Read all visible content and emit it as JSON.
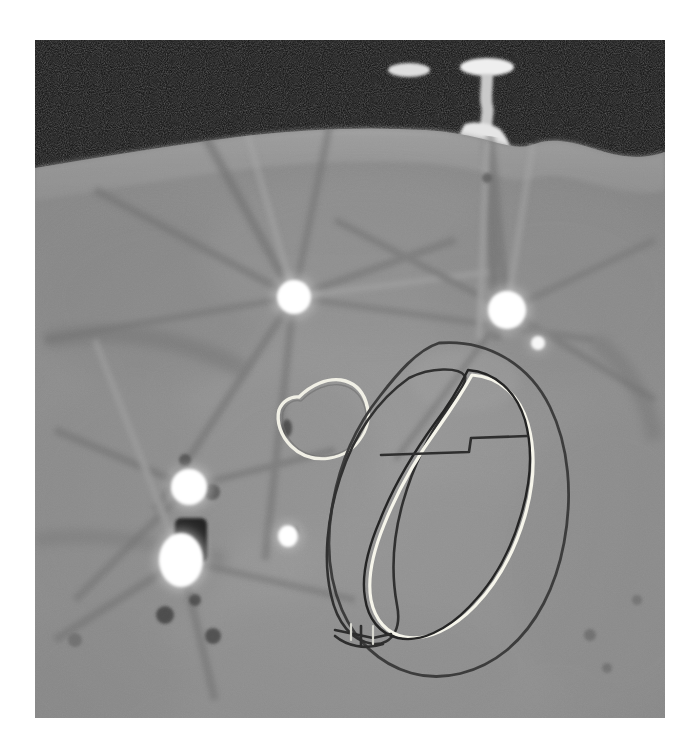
{
  "viewer": {
    "title": "CT Axial Slice — Brachytherapy Planning",
    "modality": "CT",
    "colormap": "grayscale",
    "background_color": "#ffffff"
  },
  "image_pane": {
    "left": 35,
    "top": 40,
    "width": 630,
    "height": 678,
    "air_color": "#0c0c0c",
    "soft_tissue_color": "#8e8e8e",
    "fat_color": "#9b9b9b",
    "dense_tissue_color": "#7c7c7c",
    "metal_color": "#ffffff"
  },
  "anatomy": {
    "body_surface_label": "skin-surface",
    "body_fill": "#8d8d8d",
    "subcutaneous_fill": "#9a9a9a"
  },
  "fiducials": [
    {
      "name": "applicator-cap-left",
      "cx": 409,
      "cy": 70,
      "rx": 20,
      "ry": 7,
      "brightness": "#e8e8e8"
    },
    {
      "name": "applicator-cap-right",
      "cx": 487,
      "cy": 68,
      "rx": 26,
      "ry": 9,
      "brightness": "#f2f2f2"
    },
    {
      "name": "applicator-shaft",
      "cx": 487,
      "cy": 95,
      "rx": 5,
      "ry": 22,
      "brightness": "#cfcfcf"
    },
    {
      "name": "applicator-base",
      "cx": 487,
      "cy": 125,
      "rx": 17,
      "ry": 17,
      "brightness": "#e3e3e3"
    },
    {
      "name": "catheter-marker-upper-left",
      "cx": 294,
      "cy": 297,
      "rx": 17,
      "ry": 17,
      "brightness": "#ffffff"
    },
    {
      "name": "catheter-marker-upper-right",
      "cx": 507,
      "cy": 310,
      "rx": 19,
      "ry": 19,
      "brightness": "#ffffff"
    },
    {
      "name": "catheter-marker-small-right",
      "cx": 538,
      "cy": 343,
      "rx": 7,
      "ry": 7,
      "brightness": "#f6f6f6"
    },
    {
      "name": "catheter-marker-mid-left",
      "cx": 189,
      "cy": 487,
      "rx": 18,
      "ry": 18,
      "brightness": "#ffffff"
    },
    {
      "name": "catheter-marker-lower-left",
      "cx": 181,
      "cy": 560,
      "rx": 22,
      "ry": 27,
      "brightness": "#ffffff"
    },
    {
      "name": "catheter-marker-center",
      "cx": 288,
      "cy": 536,
      "rx": 10,
      "ry": 11,
      "brightness": "#ffffff"
    }
  ],
  "contours": [
    {
      "name": "bladder-contour",
      "style": "light",
      "color": "#f0efe4",
      "stroke_width": 3.2,
      "description": "small rounded structure, upper-left of target"
    },
    {
      "name": "ptv-outer-contour",
      "style": "dark",
      "color": "#3a3a3a",
      "stroke_width": 2.6,
      "description": "large outer expansion ellipse"
    },
    {
      "name": "ctv-mid-contour",
      "style": "dark",
      "color": "#2e2e2e",
      "stroke_width": 2.6,
      "description": "middle elongated oval, offset left"
    },
    {
      "name": "gtv-light-contour",
      "style": "light",
      "color": "#f5f4ea",
      "stroke_width": 3.0,
      "description": "bright inner elongated oval"
    },
    {
      "name": "gtv-dark-contour",
      "style": "dark",
      "color": "#242424",
      "stroke_width": 2.4,
      "description": "thin dark oval adjacent to bright inner contour"
    },
    {
      "name": "oar-boundary-segment",
      "style": "dark",
      "color": "#2c2c2c",
      "stroke_width": 2.6,
      "description": "horizontal line segment crossing the target superiorly"
    },
    {
      "name": "contour-junction-notch",
      "style": "dark",
      "color": "#2c2c2c",
      "stroke_width": 2.6,
      "description": "small notch where contours converge inferiorly"
    }
  ],
  "artifacts": {
    "type": "metal-streak-artifact",
    "description": "radiating dark and bright streaks emanating from high-density markers",
    "count": 14
  }
}
